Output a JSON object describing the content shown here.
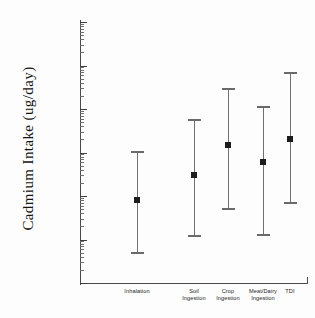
{
  "chart_data": {
    "type": "scatter",
    "title": "",
    "xlabel": "",
    "ylabel": "Cadmium Intake (ug/day)",
    "yscale": "log",
    "ylim": [
      1e-06,
      1
    ],
    "grid": false,
    "legend": null,
    "ytick_labels": [
      "1",
      "0.1",
      "0.01",
      "0.001",
      "0.0001",
      "0.00001",
      "0.000001"
    ],
    "ytick_values": [
      1,
      0.1,
      0.01,
      0.001,
      0.0001,
      1e-05,
      1e-06
    ],
    "categories": [
      "Inhalation",
      "Soil Ingestion",
      "Crop Ingestion",
      "Meat/Dairy Ingestion",
      "TDI"
    ],
    "category_lines": [
      [
        "Inhalation"
      ],
      [
        "Soil",
        "Ingestion"
      ],
      [
        "Crop",
        "Ingestion"
      ],
      [
        "Meat/Dairy",
        "Ingestion"
      ],
      [
        "TDI"
      ]
    ],
    "points": [
      {
        "category": "Inhalation",
        "value": 8e-05,
        "low": 5e-06,
        "high": 0.0011
      },
      {
        "category": "Soil Ingestion",
        "value": 0.0003,
        "low": 1.2e-05,
        "high": 0.006
      },
      {
        "category": "Crop Ingestion",
        "value": 0.0015,
        "low": 5e-05,
        "high": 0.03
      },
      {
        "category": "Meat/Dairy Ingestion",
        "value": 0.0006,
        "low": 1.3e-05,
        "high": 0.012
      },
      {
        "category": "TDI",
        "value": 0.002,
        "low": 7e-05,
        "high": 0.07
      }
    ],
    "values": [
      8e-05,
      0.0003,
      0.0015,
      0.0006,
      0.002
    ],
    "errors_low": [
      5e-06,
      1.2e-05,
      5e-05,
      1.3e-05,
      7e-05
    ],
    "errors_high": [
      0.0011,
      0.006,
      0.03,
      0.012,
      0.07
    ],
    "marker_color": "#1c1c1c",
    "errorbar_color": "#6e6e6e",
    "axis_color": "#4a4a4a"
  }
}
